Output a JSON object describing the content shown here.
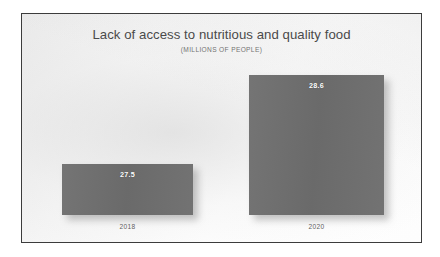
{
  "chart_data": {
    "type": "bar",
    "title": "Lack of access to nutritious and quality food",
    "subtitle": "(MILLIONS OF PEOPLE)",
    "xlabel": "",
    "ylabel": "",
    "unit": "millions of people",
    "categories": [
      "2018",
      "2020"
    ],
    "values": [
      27.5,
      28.6
    ],
    "value_labels": [
      "27.5",
      "28.6"
    ],
    "ylim": [
      0,
      30
    ],
    "grid": false,
    "legend": null,
    "series": [
      {
        "name": "Lack of access to nutritious and quality food",
        "values": [
          27.5,
          28.6
        ]
      }
    ],
    "colors": {
      "bar_fill": "#6e6e6e",
      "value_label": "#ffffff",
      "category_label": "#5e5e5e",
      "title": "#4a4a4a",
      "subtitle": "#737373",
      "frame_border": "#3c3c3c",
      "background": "#f4f4f4"
    }
  },
  "bars": [
    {
      "category": "2018",
      "value_label": "27.5"
    },
    {
      "category": "2020",
      "value_label": "28.6"
    }
  ]
}
